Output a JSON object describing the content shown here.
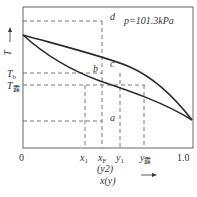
{
  "pressure_label": "p=101.3kPa",
  "axes": {
    "y_label": "T",
    "x_label": "x(y)",
    "origin": "0",
    "x_max": "1.0"
  },
  "x_ticks": [
    {
      "base": "x",
      "sub": "1"
    },
    {
      "base": "x",
      "sub": "F"
    },
    {
      "base": "y",
      "sub": "1"
    },
    {
      "base": "y",
      "sub": "露"
    }
  ],
  "x_tick_extra": "(y2)",
  "y_ticks": [
    {
      "base": "T",
      "sub": "b"
    },
    {
      "base": "T",
      "sub": "露"
    }
  ],
  "points": {
    "a": "a",
    "b": "b",
    "c": "c",
    "d": "d"
  },
  "colors": {
    "curve": "#2a2a2a",
    "dashed": "#555555",
    "frame": "#444444"
  }
}
